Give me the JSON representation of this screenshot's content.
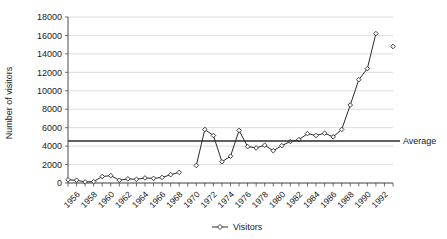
{
  "chart_data": {
    "type": "line",
    "title": "",
    "xlabel": "",
    "ylabel": "Number of visitors",
    "ylim": [
      0,
      18000
    ],
    "xlim": [
      1955,
      1993
    ],
    "grid": true,
    "legend_position": "bottom",
    "y_ticks": [
      0,
      2000,
      4000,
      6000,
      8000,
      10000,
      12000,
      14000,
      16000,
      18000
    ],
    "y_tick_labels": [
      "0",
      "2000",
      "4000",
      "6000",
      "8000",
      "10000",
      "12000",
      "14000",
      "16000",
      "18000"
    ],
    "x_tick_labels": [
      "1956",
      "1958",
      "1960",
      "1962",
      "1964",
      "1966",
      "1968",
      "1970",
      "1972",
      "1974",
      "1976",
      "1978",
      "1980",
      "1982",
      "1984",
      "1986",
      "1988",
      "1990",
      "1992"
    ],
    "x_tick_years": [
      1956,
      1958,
      1960,
      1962,
      1964,
      1966,
      1968,
      1970,
      1972,
      1974,
      1976,
      1978,
      1980,
      1982,
      1984,
      1986,
      1988,
      1990,
      1992
    ],
    "x_minor_years": [
      1955,
      1956,
      1957,
      1958,
      1959,
      1960,
      1961,
      1962,
      1963,
      1964,
      1965,
      1966,
      1967,
      1968,
      1969,
      1970,
      1971,
      1972,
      1973,
      1974,
      1975,
      1976,
      1977,
      1978,
      1979,
      1980,
      1981,
      1982,
      1983,
      1984,
      1985,
      1986,
      1987,
      1988,
      1989,
      1990,
      1991,
      1992,
      1993
    ],
    "series": [
      {
        "name": "Visitors",
        "marker": "diamond",
        "segments": [
          {
            "x": [
              1955,
              1956,
              1957,
              1958,
              1959,
              1960,
              1961,
              1962,
              1963,
              1964,
              1965,
              1966,
              1967,
              1968
            ],
            "values": [
              350,
              300,
              120,
              150,
              700,
              800,
              300,
              450,
              400,
              550,
              500,
              600,
              900,
              1150
            ]
          },
          {
            "x": [
              1970,
              1971,
              1972,
              1973,
              1974,
              1975,
              1976,
              1977,
              1978,
              1979,
              1980,
              1981,
              1982,
              1983,
              1984,
              1985,
              1986,
              1987,
              1988,
              1989,
              1990,
              1991
            ],
            "values": [
              1900,
              5800,
              5150,
              2300,
              2900,
              5700,
              3950,
              3800,
              4100,
              3500,
              4050,
              4500,
              4700,
              5350,
              5150,
              5400,
              5000,
              5800,
              8450,
              11200,
              12400,
              16200
            ]
          },
          {
            "x": [
              1993
            ],
            "values": [
              14800
            ]
          }
        ]
      }
    ],
    "average_line": {
      "label": "Average",
      "value": 4550,
      "color": "#2b2b2b"
    },
    "legend": [
      {
        "label": "Visitors",
        "marker": "diamond",
        "color": "#2b2b2b"
      }
    ]
  },
  "colors": {
    "grid": "#cfcfcf",
    "axis": "#4d4d4d",
    "series": "#2b2b2b",
    "background": "#ffffff"
  }
}
